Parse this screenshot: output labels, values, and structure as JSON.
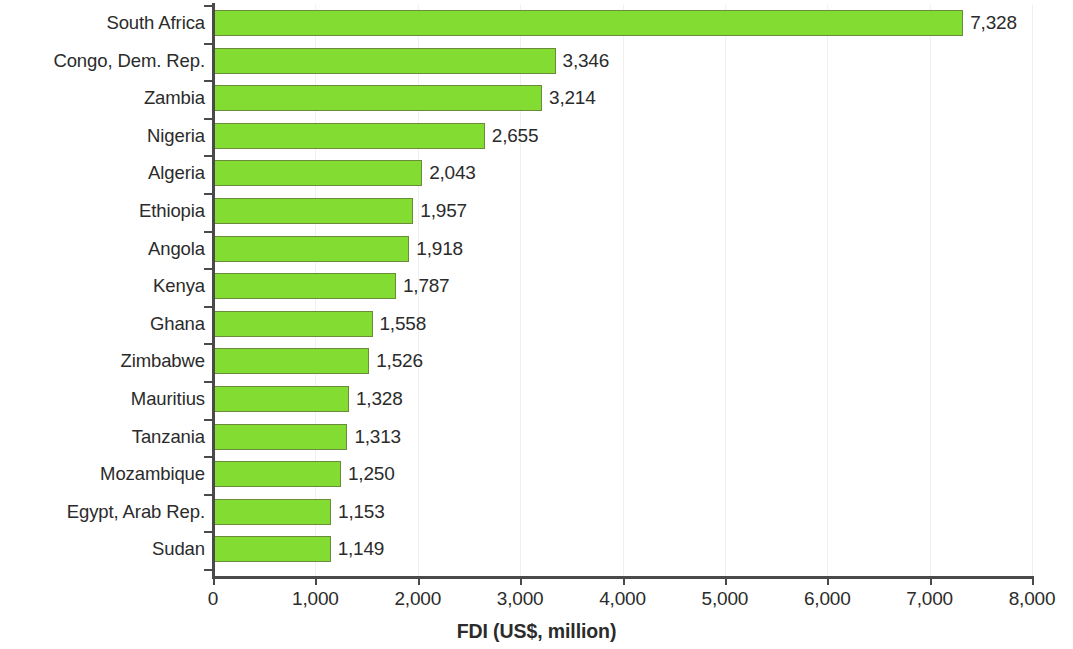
{
  "chart_data": {
    "type": "bar",
    "orientation": "horizontal",
    "title": "",
    "xlabel": "FDI (US$, million)",
    "ylabel": "",
    "xlim": [
      0,
      8000
    ],
    "x_ticks": [
      "0",
      "1,000",
      "2,000",
      "3,000",
      "4,000",
      "5,000",
      "6,000",
      "7,000",
      "8,000"
    ],
    "x_tick_values": [
      0,
      1000,
      2000,
      3000,
      4000,
      5000,
      6000,
      7000,
      8000
    ],
    "grid": "vertical-light",
    "legend": "none",
    "categories": [
      "South Africa",
      "Congo, Dem. Rep.",
      "Zambia",
      "Nigeria",
      "Algeria",
      "Ethiopia",
      "Angola",
      "Kenya",
      "Ghana",
      "Zimbabwe",
      "Mauritius",
      "Tanzania",
      "Mozambique",
      "Egypt, Arab Rep.",
      "Sudan"
    ],
    "values": [
      7328,
      3346,
      3214,
      2655,
      2043,
      1957,
      1918,
      1787,
      1558,
      1526,
      1328,
      1313,
      1250,
      1153,
      1149
    ],
    "value_labels": [
      "7,328",
      "3,346",
      "3,214",
      "2,655",
      "2,043",
      "1,957",
      "1,918",
      "1,787",
      "1,558",
      "1,526",
      "1,328",
      "1,313",
      "1,250",
      "1,153",
      "1,149"
    ],
    "colors": {
      "bar_fill": "#82dc32",
      "bar_stroke": "#6a8c3a",
      "axis": "#4a4a4a",
      "text": "#2b2b2b",
      "grid": "#f0f0f0",
      "background": "#ffffff"
    }
  }
}
